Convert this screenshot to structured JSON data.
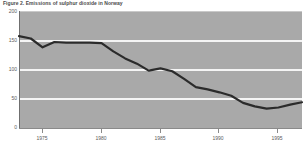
{
  "figure": {
    "title": "Figure 2. Emissions of sulphur dioxide in Norway"
  },
  "chart_data": {
    "type": "line",
    "title": "Figure 2. Emissions of sulphur dioxide in Norway",
    "xlabel": "",
    "ylabel": "",
    "xlim": [
      1973,
      1997
    ],
    "ylim": [
      0,
      200
    ],
    "yticks": [
      0,
      50,
      100,
      150,
      200
    ],
    "ytick_labels": [
      "0",
      "50",
      "100",
      "150",
      "200"
    ],
    "xticks": [
      1975,
      1980,
      1985,
      1990,
      1995
    ],
    "xtick_labels": [
      "1975",
      "1980",
      "1985",
      "1990",
      "1995"
    ],
    "grid": true,
    "grid_axis": "y",
    "legend": null,
    "series": [
      {
        "name": "Emissions of sulphur dioxide",
        "color": "#2b2b2b",
        "x": [
          1973,
          1974,
          1975,
          1976,
          1977,
          1978,
          1979,
          1980,
          1981,
          1982,
          1983,
          1984,
          1985,
          1986,
          1987,
          1988,
          1989,
          1990,
          1991,
          1992,
          1993,
          1994,
          1995,
          1996,
          1997
        ],
        "values": [
          157,
          153,
          138,
          147,
          146,
          146,
          146,
          145,
          131,
          119,
          110,
          98,
          102,
          97,
          84,
          70,
          66,
          61,
          55,
          43,
          37,
          33,
          35,
          40,
          44
        ]
      }
    ]
  }
}
